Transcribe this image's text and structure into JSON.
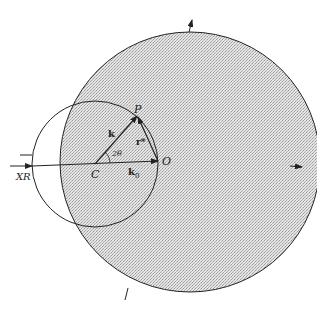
{
  "colors": {
    "fill": "#d9d9d9",
    "stroke": "#222222",
    "background": "#ffffff"
  },
  "labels": {
    "P": "P",
    "O": "O",
    "C": "C",
    "XR": "XR",
    "k": "k",
    "k0": "k",
    "k0_sub": "0",
    "r_star": "r*",
    "two_theta": "2θ"
  }
}
